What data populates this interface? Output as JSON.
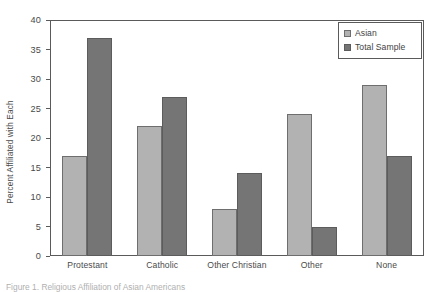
{
  "chart_data": {
    "type": "bar",
    "title": "",
    "xlabel": "",
    "ylabel": "Percent Affiliated with Each",
    "ylim": [
      0,
      40
    ],
    "ytick_step": 5,
    "yticks": [
      0,
      5,
      10,
      15,
      20,
      25,
      30,
      35,
      40
    ],
    "grid": false,
    "legend_position": "top-right",
    "categories": [
      "Protestant",
      "Catholic",
      "Other Christian",
      "Other",
      "None"
    ],
    "series": [
      {
        "name": "Asian",
        "color": "#b2b2b2",
        "values": [
          17,
          22,
          8,
          24,
          29
        ]
      },
      {
        "name": "Total Sample",
        "color": "#757575",
        "values": [
          37,
          27,
          14,
          5,
          17
        ]
      }
    ]
  },
  "legend": {
    "items": [
      {
        "label": "Asian"
      },
      {
        "label": "Total Sample"
      }
    ]
  },
  "caption": {
    "text": "Figure 1. Religious Affiliation of Asian Americans"
  }
}
